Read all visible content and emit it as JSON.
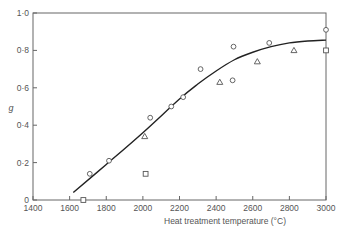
{
  "chart_data": {
    "type": "scatter",
    "title": "",
    "xlabel": "Heat treatment temperature (°C)",
    "ylabel": "g",
    "xlim": [
      1400,
      3000
    ],
    "ylim": [
      0,
      1.0
    ],
    "x_ticks": [
      1400,
      1600,
      1800,
      2000,
      2200,
      2400,
      2600,
      2800,
      3000
    ],
    "x_tick_labels": [
      "1400",
      "1600",
      "1800",
      "2000",
      "2200",
      "2400",
      "2600",
      "2800",
      "3000"
    ],
    "y_ticks": [
      0,
      0.2,
      0.4,
      0.6,
      0.8,
      1.0
    ],
    "y_tick_labels": [
      "0",
      "0·2",
      "0·4",
      "0·6",
      "0·8",
      "1·0"
    ],
    "grid": false,
    "legend": null,
    "series": [
      {
        "name": "circles",
        "marker": "circle",
        "points": [
          [
            1710,
            0.14
          ],
          [
            1815,
            0.21
          ],
          [
            2040,
            0.44
          ],
          [
            2155,
            0.5
          ],
          [
            2220,
            0.55
          ],
          [
            2315,
            0.7
          ],
          [
            2490,
            0.64
          ],
          [
            2495,
            0.82
          ],
          [
            2690,
            0.84
          ],
          [
            3000,
            0.91
          ]
        ]
      },
      {
        "name": "triangles",
        "marker": "triangle",
        "points": [
          [
            2010,
            0.34
          ],
          [
            2420,
            0.63
          ],
          [
            2625,
            0.74
          ],
          [
            2825,
            0.8
          ]
        ]
      },
      {
        "name": "squares",
        "marker": "square",
        "points": [
          [
            1675,
            0.0
          ],
          [
            2015,
            0.14
          ],
          [
            3000,
            0.8
          ]
        ]
      },
      {
        "name": "fitted curve",
        "marker": "line",
        "points": [
          [
            1620,
            0.04
          ],
          [
            1800,
            0.19
          ],
          [
            2000,
            0.36
          ],
          [
            2200,
            0.54
          ],
          [
            2300,
            0.62
          ],
          [
            2400,
            0.69
          ],
          [
            2500,
            0.75
          ],
          [
            2600,
            0.79
          ],
          [
            2700,
            0.82
          ],
          [
            2800,
            0.84
          ],
          [
            2900,
            0.85
          ],
          [
            3000,
            0.855
          ]
        ]
      }
    ]
  },
  "colors": {
    "axis": "#666666",
    "line": "#222222",
    "marker": "#555555"
  }
}
